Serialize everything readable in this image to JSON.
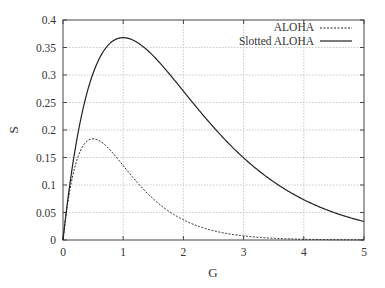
{
  "chart_data": {
    "type": "line",
    "title": "",
    "xlabel": "G",
    "ylabel": "S",
    "xlim": [
      0,
      5
    ],
    "ylim": [
      0,
      0.4
    ],
    "grid": true,
    "legend_position": "top-right",
    "x_ticks": [
      "0",
      "1",
      "2",
      "3",
      "4",
      "5"
    ],
    "y_ticks": [
      "0",
      "0.05",
      "0.1",
      "0.15",
      "0.2",
      "0.25",
      "0.3",
      "0.35",
      "0.4"
    ],
    "x": [
      0,
      0.25,
      0.5,
      0.75,
      1,
      1.5,
      2,
      2.5,
      3,
      3.5,
      4,
      4.5,
      5
    ],
    "series": [
      {
        "name": "ALOHA",
        "style": "dashed",
        "formula": "S = G*exp(-2G)",
        "values": [
          0,
          0.152,
          0.184,
          0.167,
          0.135,
          0.075,
          0.037,
          0.017,
          0.007,
          0.003,
          0.001,
          0.0006,
          0.0002
        ]
      },
      {
        "name": "Slotted ALOHA",
        "style": "solid",
        "formula": "S = G*exp(-G)",
        "values": [
          0,
          0.195,
          0.303,
          0.354,
          0.368,
          0.335,
          0.271,
          0.205,
          0.149,
          0.106,
          0.073,
          0.05,
          0.034
        ]
      }
    ]
  }
}
